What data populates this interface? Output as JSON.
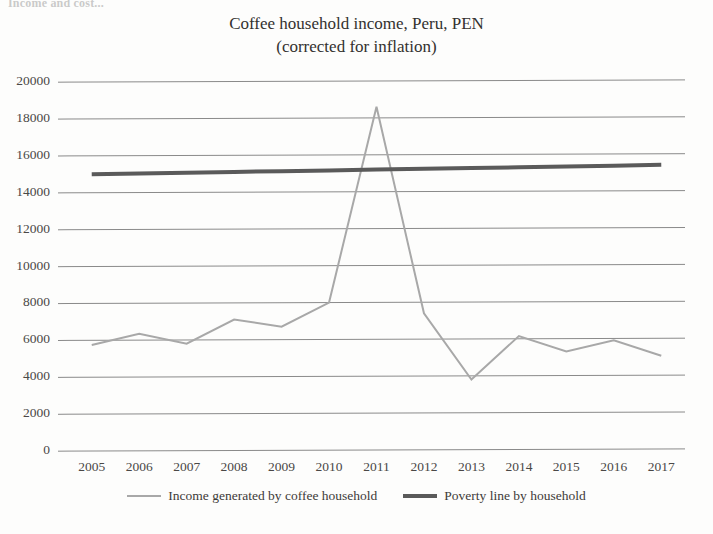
{
  "clipped_header_text": "Income and cost...",
  "chart_data": {
    "type": "line",
    "title": "Coffee household income, Peru, PEN",
    "subtitle": "(corrected for inflation)",
    "xlabel": "",
    "ylabel": "",
    "x": [
      2005,
      2006,
      2007,
      2008,
      2009,
      2010,
      2011,
      2012,
      2013,
      2014,
      2015,
      2016,
      2017
    ],
    "categories": [
      "2005",
      "2006",
      "2007",
      "2008",
      "2009",
      "2010",
      "2011",
      "2012",
      "2013",
      "2014",
      "2015",
      "2016",
      "2017"
    ],
    "ylim": [
      0,
      20000
    ],
    "yticks": [
      0,
      2000,
      4000,
      6000,
      8000,
      10000,
      12000,
      14000,
      16000,
      18000,
      20000
    ],
    "ytick_labels": [
      "0",
      "2000",
      "4000",
      "6000",
      "8000",
      "10000",
      "12000",
      "14000",
      "16000",
      "18000",
      "20000"
    ],
    "grid": true,
    "legend_position": "bottom",
    "series": [
      {
        "name": "Income generated by coffee household",
        "color": "#a8a8a8",
        "width": 2,
        "values": [
          5750,
          6350,
          5800,
          7100,
          6700,
          8000,
          18600,
          7400,
          3800,
          6150,
          5300,
          5900,
          5050
        ]
      },
      {
        "name": "Poverty line by household",
        "color": "#5a5a5a",
        "width": 4,
        "values": [
          15000,
          15030,
          15060,
          15100,
          15130,
          15160,
          15200,
          15230,
          15260,
          15300,
          15330,
          15360,
          15400
        ]
      }
    ]
  },
  "legend": {
    "items": [
      {
        "label": "Income generated by coffee household"
      },
      {
        "label": "Poverty line by household"
      }
    ]
  },
  "colors": {
    "income_line": "#a8a8a8",
    "poverty_line": "#5a5a5a",
    "gridline": "#8a8a8a",
    "background": "#fdfdfc",
    "text": "#3a3a3a"
  }
}
